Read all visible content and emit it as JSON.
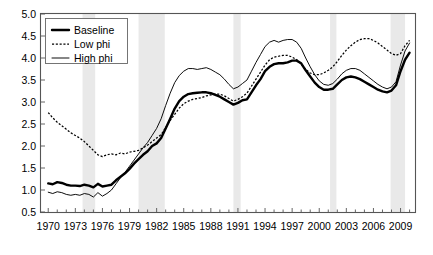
{
  "chart_data": {
    "type": "line",
    "title": "",
    "subtitle": "",
    "xlabel": "",
    "ylabel": "",
    "xlim": [
      1969.2,
      2010.6
    ],
    "ylim": [
      0.5,
      5.0
    ],
    "grid": false,
    "legend_position": "top-left",
    "x_ticks": [
      1970,
      1973,
      1976,
      1979,
      1982,
      1985,
      1988,
      1991,
      1994,
      1997,
      2000,
      2003,
      2006,
      2009
    ],
    "x_tick_labels": [
      "1970",
      "1973",
      "1976",
      "1979",
      "1982",
      "1985",
      "1988",
      "1991",
      "1994",
      "1997",
      "2000",
      "2003",
      "2006",
      "2009"
    ],
    "x_minor_tick_step": 1,
    "y_ticks": [
      0.5,
      1.0,
      1.5,
      2.0,
      2.5,
      3.0,
      3.5,
      4.0,
      4.5,
      5.0
    ],
    "y_tick_labels": [
      "0.5",
      "1.0",
      "1.5",
      "2.0",
      "2.5",
      "3.0",
      "3.5",
      "4.0",
      "4.5",
      "5.0"
    ],
    "shaded_bands": [
      {
        "label": "recession-1974",
        "x0": 1973.8,
        "x1": 1975.2,
        "color": "#e9e9e9"
      },
      {
        "label": "recession-1980",
        "x0": 1980.0,
        "x1": 1982.9,
        "color": "#e9e9e9"
      },
      {
        "label": "recession-1990",
        "x0": 1990.5,
        "x1": 1991.3,
        "color": "#e9e9e9"
      },
      {
        "label": "recession-2001",
        "x0": 2001.2,
        "x1": 2001.9,
        "color": "#e9e9e9"
      },
      {
        "label": "recession-2008",
        "x0": 2007.9,
        "x1": 2009.5,
        "color": "#e9e9e9"
      }
    ],
    "x": [
      1970.0,
      1970.5,
      1971.0,
      1971.5,
      1972.0,
      1972.5,
      1973.0,
      1973.5,
      1974.0,
      1974.5,
      1975.0,
      1975.5,
      1976.0,
      1976.5,
      1977.0,
      1977.5,
      1978.0,
      1978.5,
      1979.0,
      1979.5,
      1980.0,
      1980.5,
      1981.0,
      1981.5,
      1982.0,
      1982.5,
      1983.0,
      1983.5,
      1984.0,
      1984.5,
      1985.0,
      1985.5,
      1986.0,
      1986.5,
      1987.0,
      1987.5,
      1988.0,
      1988.5,
      1989.0,
      1989.5,
      1990.0,
      1990.5,
      1991.0,
      1991.5,
      1992.0,
      1992.5,
      1993.0,
      1993.5,
      1994.0,
      1994.5,
      1995.0,
      1995.5,
      1996.0,
      1996.5,
      1997.0,
      1997.5,
      1998.0,
      1998.5,
      1999.0,
      1999.5,
      2000.0,
      2000.5,
      2001.0,
      2001.5,
      2002.0,
      2002.5,
      2003.0,
      2003.5,
      2004.0,
      2004.5,
      2005.0,
      2005.5,
      2006.0,
      2006.5,
      2007.0,
      2007.5,
      2008.0,
      2008.5,
      2009.0,
      2009.5,
      2010.0
    ],
    "series": [
      {
        "name": "Baseline",
        "style": "solid-thick",
        "color": "#000000",
        "values": [
          1.15,
          1.13,
          1.18,
          1.16,
          1.12,
          1.1,
          1.1,
          1.09,
          1.12,
          1.1,
          1.06,
          1.14,
          1.08,
          1.1,
          1.12,
          1.22,
          1.3,
          1.38,
          1.48,
          1.6,
          1.7,
          1.8,
          1.88,
          2.0,
          2.06,
          2.18,
          2.4,
          2.62,
          2.85,
          3.02,
          3.12,
          3.18,
          3.2,
          3.21,
          3.22,
          3.22,
          3.2,
          3.16,
          3.12,
          3.06,
          3.0,
          2.94,
          2.98,
          3.04,
          3.06,
          3.22,
          3.38,
          3.52,
          3.7,
          3.8,
          3.86,
          3.88,
          3.88,
          3.9,
          3.94,
          3.94,
          3.88,
          3.72,
          3.58,
          3.44,
          3.34,
          3.28,
          3.28,
          3.3,
          3.4,
          3.5,
          3.56,
          3.58,
          3.56,
          3.52,
          3.46,
          3.4,
          3.34,
          3.28,
          3.24,
          3.22,
          3.26,
          3.38,
          3.7,
          3.96,
          4.12
        ]
      },
      {
        "name": "Low phi",
        "style": "dotted",
        "color": "#000000",
        "values": [
          2.76,
          2.64,
          2.54,
          2.46,
          2.38,
          2.3,
          2.24,
          2.18,
          2.1,
          2.0,
          1.9,
          1.8,
          1.76,
          1.8,
          1.82,
          1.8,
          1.84,
          1.82,
          1.86,
          1.88,
          1.9,
          1.96,
          2.02,
          2.1,
          2.18,
          2.26,
          2.42,
          2.58,
          2.72,
          2.86,
          2.96,
          3.02,
          3.06,
          3.08,
          3.1,
          3.14,
          3.16,
          3.18,
          3.18,
          3.14,
          3.08,
          3.02,
          3.06,
          3.12,
          3.2,
          3.36,
          3.52,
          3.68,
          3.84,
          3.96,
          4.02,
          4.04,
          4.06,
          4.06,
          4.02,
          3.96,
          3.86,
          3.74,
          3.66,
          3.62,
          3.62,
          3.66,
          3.72,
          3.8,
          3.92,
          4.06,
          4.18,
          4.28,
          4.36,
          4.42,
          4.44,
          4.44,
          4.4,
          4.34,
          4.26,
          4.18,
          4.1,
          4.06,
          4.1,
          4.28,
          4.4
        ]
      },
      {
        "name": "High phi",
        "style": "solid-thin",
        "color": "#000000",
        "values": [
          0.95,
          0.92,
          0.96,
          0.94,
          0.9,
          0.88,
          0.9,
          0.88,
          0.92,
          0.9,
          0.84,
          0.94,
          0.86,
          0.92,
          1.0,
          1.14,
          1.28,
          1.4,
          1.54,
          1.68,
          1.82,
          1.96,
          2.08,
          2.24,
          2.4,
          2.62,
          2.92,
          3.2,
          3.44,
          3.6,
          3.7,
          3.76,
          3.76,
          3.74,
          3.76,
          3.78,
          3.74,
          3.68,
          3.62,
          3.52,
          3.4,
          3.3,
          3.34,
          3.42,
          3.5,
          3.7,
          3.9,
          4.08,
          4.26,
          4.36,
          4.4,
          4.36,
          4.4,
          4.42,
          4.42,
          4.36,
          4.22,
          4.0,
          3.8,
          3.62,
          3.48,
          3.4,
          3.38,
          3.42,
          3.52,
          3.64,
          3.72,
          3.76,
          3.76,
          3.72,
          3.64,
          3.56,
          3.48,
          3.4,
          3.34,
          3.3,
          3.34,
          3.46,
          3.84,
          4.16,
          4.34
        ]
      }
    ]
  },
  "legend": {
    "items": [
      {
        "label": "Baseline",
        "style": "solid-thick"
      },
      {
        "label": "Low phi",
        "style": "dotted"
      },
      {
        "label": "High phi",
        "style": "solid-thin"
      }
    ]
  }
}
